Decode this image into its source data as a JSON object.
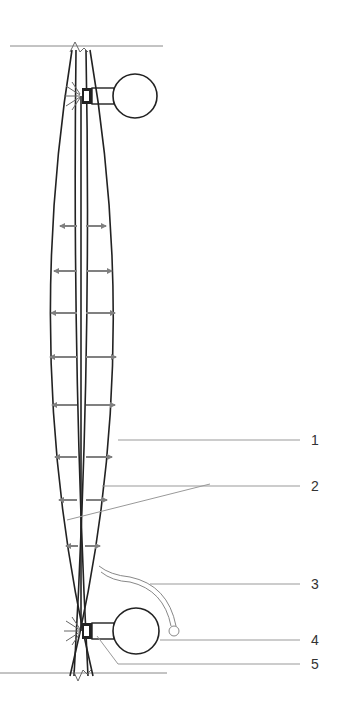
{
  "diagram": {
    "type": "technical-schematic",
    "colors": {
      "outline": "#222222",
      "arrow": "#808080",
      "leader": "#999999",
      "ground_line": "#888888",
      "label_text": "#333333"
    },
    "labels": [
      {
        "id": "1",
        "text": "1",
        "x": 314,
        "y": 430
      },
      {
        "id": "2",
        "text": "2",
        "x": 314,
        "y": 476
      },
      {
        "id": "3",
        "text": "3",
        "x": 314,
        "y": 576
      },
      {
        "id": "4",
        "text": "4",
        "x": 314,
        "y": 632
      },
      {
        "id": "5",
        "text": "5",
        "x": 314,
        "y": 656
      }
    ],
    "arrow_rows_y": [
      226,
      271,
      313,
      357,
      405,
      457,
      500,
      546
    ]
  }
}
